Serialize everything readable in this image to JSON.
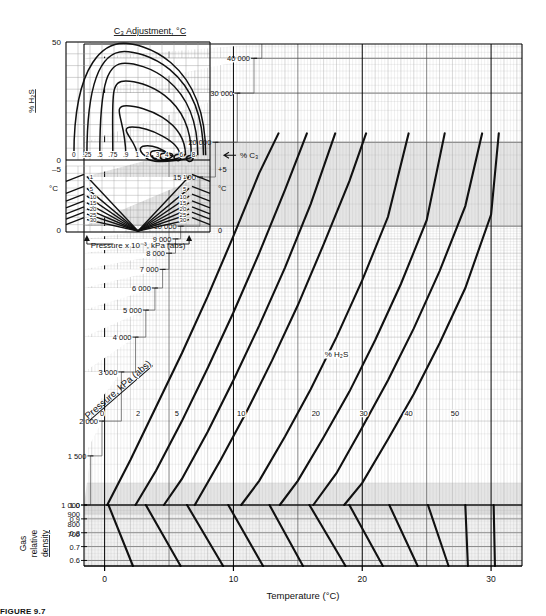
{
  "figure": {
    "caption": "FIGURE 9.7",
    "colors": {
      "curve": "#111111",
      "grid_major": "#555555",
      "grid_minor": "#9a9a9a",
      "band": "#cfcfcf",
      "axis": "#000000"
    }
  },
  "main_chart": {
    "xlabel": "Temperature (°C)",
    "ylabel": "Pressure, kPa (abs)",
    "secondary_ylabel_lines": [
      "Gas",
      "relative",
      "density"
    ],
    "series_label": "% H₂S",
    "x_ticks": [
      "0",
      "10",
      "20",
      "30"
    ],
    "pressure_ticks": [
      "40 000",
      "30 000",
      "20 000",
      "15 000",
      "10 000",
      "9 000",
      "8 000",
      "7 000",
      "6 000",
      "5 000",
      "4 000",
      "3 000",
      "2 000",
      "1 500",
      "1 000",
      "900",
      "800",
      "700"
    ],
    "density_ticks": [
      "1.0",
      "0.9",
      "0.8",
      "0.7",
      "0.6"
    ],
    "h2s_curve_labels": [
      "0",
      "2",
      "5",
      "10",
      "20",
      "30",
      "40",
      "50"
    ]
  },
  "inset_c3": {
    "title": "C₃ Adjustment, °C",
    "ylabel_top": "% H₂S",
    "ylabel_bottom": "°C",
    "y_ticks_top": [
      "50",
      "0"
    ],
    "y_ticks_mid": [
      "–5"
    ],
    "y_ticks_bottom": [
      "0"
    ],
    "right_ticks": [
      "+5",
      "° C",
      "0"
    ],
    "xlabel_right": "% C₃",
    "contour_labels": [
      "0",
      ".25",
      ".5",
      ".75",
      ".9",
      "1",
      "2",
      "3",
      "4",
      "6",
      "8"
    ],
    "pressure_label": "Pressure x 10⁻³, kPa (abs)",
    "fan_labels": [
      "1",
      "5",
      "10",
      "15",
      "20",
      "25",
      "30"
    ]
  },
  "chart_data": {
    "type": "line",
    "xlabel": "Temperature (°C)",
    "ylabel": "Pressure, kPa (abs)",
    "xlim": [
      -1.5,
      32.5
    ],
    "ylim_log": [
      600,
      45000
    ],
    "yscale": "log",
    "grid": true,
    "legend": "% H₂S curve labels placed inline on curves",
    "series": [
      {
        "name": "0",
        "x": [
          0.2,
          2.0,
          4.0,
          6.0,
          8.0,
          10.0,
          12.0,
          13.5
        ],
        "y": [
          1000,
          1450,
          2250,
          3500,
          5600,
          9200,
          15500,
          21500
        ]
      },
      {
        "name": "2",
        "x": [
          2.4,
          4.0,
          6.0,
          8.0,
          10.0,
          12.0,
          14.0,
          15.7
        ],
        "y": [
          1000,
          1330,
          2000,
          3100,
          4900,
          8000,
          13500,
          21500
        ]
      },
      {
        "name": "5",
        "x": [
          4.6,
          6.0,
          8.0,
          10.0,
          12.0,
          14.0,
          16.0,
          17.9
        ],
        "y": [
          1000,
          1240,
          1830,
          2800,
          4400,
          7100,
          12000,
          21500
        ]
      },
      {
        "name": "10",
        "x": [
          7.0,
          9.0,
          11.0,
          13.0,
          15.0,
          17.0,
          19.0,
          20.3
        ],
        "y": [
          1000,
          1450,
          2150,
          3300,
          5200,
          8600,
          14500,
          21500
        ]
      },
      {
        "name": "20",
        "x": [
          10.6,
          12.0,
          14.0,
          16.0,
          18.0,
          20.0,
          22.0,
          23.6
        ],
        "y": [
          1000,
          1220,
          1760,
          2600,
          4000,
          6400,
          10800,
          21500
        ]
      },
      {
        "name": "30",
        "x": [
          13.6,
          15.0,
          17.0,
          19.0,
          21.0,
          23.0,
          25.0,
          26.4
        ],
        "y": [
          1000,
          1220,
          1750,
          2550,
          3900,
          6200,
          10500,
          21500
        ]
      },
      {
        "name": "40",
        "x": [
          16.2,
          18.0,
          20.0,
          22.0,
          24.0,
          26.0,
          28.0,
          29.3
        ],
        "y": [
          1000,
          1300,
          1900,
          2800,
          4300,
          6900,
          11800,
          21500
        ]
      },
      {
        "name": "50",
        "x": [
          18.6,
          20.0,
          22.0,
          24.0,
          26.0,
          28.0,
          30.0,
          30.6
        ],
        "y": [
          1000,
          1200,
          1720,
          2500,
          3800,
          6000,
          11000,
          21500
        ]
      }
    ],
    "density_lines": [
      {
        "name": "0.6",
        "x0": 0.3,
        "y0": 1000,
        "x1": 2.2,
        "y1": 600
      },
      {
        "name": "0.7",
        "x0": 3.2,
        "y0": 1000,
        "x1": 5.9,
        "y1": 600
      },
      {
        "name": "0.8",
        "x0": 6.4,
        "y0": 1000,
        "x1": 9.2,
        "y1": 600
      },
      {
        "name": "0.9",
        "x0": 9.6,
        "y0": 1000,
        "x1": 12.3,
        "y1": 600
      },
      {
        "name": "1.0",
        "x0": 12.8,
        "y0": 1000,
        "x1": 15.4,
        "y1": 600
      },
      {
        "name": "1.1",
        "x0": 15.9,
        "y0": 1000,
        "x1": 18.7,
        "y1": 600
      },
      {
        "name": "1.2",
        "x0": 19.0,
        "y0": 1000,
        "x1": 21.6,
        "y1": 600
      },
      {
        "name": "1.3",
        "x0": 22.1,
        "y0": 1000,
        "x1": 24.3,
        "y1": 600
      },
      {
        "name": "1.4",
        "x0": 25.1,
        "y0": 1000,
        "x1": 26.7,
        "y1": 600
      },
      {
        "name": "1.5",
        "x0": 28.0,
        "y0": 1000,
        "x1": 28.2,
        "y1": 600
      },
      {
        "name": "1.6",
        "x0": 30.2,
        "y0": 1000,
        "x1": 30.3,
        "y1": 600
      }
    ]
  }
}
